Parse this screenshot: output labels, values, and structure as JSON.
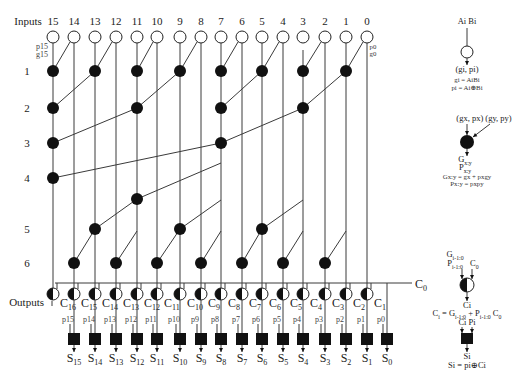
{
  "diagram": {
    "inputs_label": "Inputs",
    "outputs_label": "Outputs",
    "inputs": {
      "columns": [
        "15",
        "14",
        "13",
        "12",
        "11",
        "10",
        "9",
        "8",
        "7",
        "6",
        "5",
        "4",
        "3",
        "2",
        "1",
        "0"
      ]
    },
    "left_pg_labels": [
      "p15",
      "g15"
    ],
    "right_pg_labels": [
      "p0",
      "g0"
    ],
    "row_labels": [
      {
        "label": "1",
        "level": "1"
      },
      {
        "label": "2",
        "level": "2"
      },
      {
        "label": "3",
        "level": "3"
      },
      {
        "label": "4",
        "level": "4"
      },
      {
        "label": "5",
        "level": "5"
      },
      {
        "label": "6",
        "level": "6"
      }
    ],
    "prefix_edges": [
      {
        "to": [
          15,
          "1"
        ],
        "from": [
          14,
          "in"
        ]
      },
      {
        "to": [
          13,
          "1"
        ],
        "from": [
          12,
          "in"
        ]
      },
      {
        "to": [
          11,
          "1"
        ],
        "from": [
          10,
          "in"
        ]
      },
      {
        "to": [
          9,
          "1"
        ],
        "from": [
          8,
          "in"
        ]
      },
      {
        "to": [
          7,
          "1"
        ],
        "from": [
          6,
          "in"
        ]
      },
      {
        "to": [
          5,
          "1"
        ],
        "from": [
          4,
          "in"
        ]
      },
      {
        "to": [
          3,
          "1"
        ],
        "from": [
          2,
          "in"
        ]
      },
      {
        "to": [
          1,
          "1"
        ],
        "from": [
          0,
          "in"
        ]
      },
      {
        "to": [
          15,
          "2"
        ],
        "from": [
          13,
          "1"
        ]
      },
      {
        "to": [
          11,
          "2"
        ],
        "from": [
          9,
          "1"
        ]
      },
      {
        "to": [
          7,
          "2"
        ],
        "from": [
          5,
          "1"
        ]
      },
      {
        "to": [
          3,
          "2"
        ],
        "from": [
          1,
          "1"
        ]
      },
      {
        "to": [
          15,
          "3"
        ],
        "from": [
          11,
          "2"
        ]
      },
      {
        "to": [
          7,
          "3"
        ],
        "from": [
          3,
          "2"
        ]
      },
      {
        "to": [
          15,
          "4"
        ],
        "from": [
          7,
          "3"
        ]
      },
      {
        "to": [
          11,
          "4b"
        ],
        "from": [
          7,
          "w163"
        ]
      },
      {
        "to": [
          13,
          "5"
        ],
        "from": [
          11,
          "4b"
        ]
      },
      {
        "to": [
          9,
          "5"
        ],
        "from": [
          7,
          "w200"
        ]
      },
      {
        "to": [
          5,
          "5"
        ],
        "from": [
          3,
          "w200"
        ]
      },
      {
        "to": [
          14,
          "6"
        ],
        "from": [
          13,
          "5"
        ]
      },
      {
        "to": [
          12,
          "6"
        ],
        "from": [
          11,
          "w231"
        ]
      },
      {
        "to": [
          10,
          "6"
        ],
        "from": [
          9,
          "5"
        ]
      },
      {
        "to": [
          8,
          "6"
        ],
        "from": [
          7,
          "w231"
        ]
      },
      {
        "to": [
          6,
          "6"
        ],
        "from": [
          5,
          "5"
        ]
      },
      {
        "to": [
          4,
          "6"
        ],
        "from": [
          3,
          "w231"
        ]
      },
      {
        "to": [
          2,
          "6"
        ],
        "from": [
          1,
          "w231"
        ]
      }
    ],
    "carry_in": {
      "base": "C",
      "sub": "0"
    },
    "carry_outputs": [
      {
        "base": "C",
        "sub": "16"
      },
      {
        "base": "C",
        "sub": "15"
      },
      {
        "base": "C",
        "sub": "14"
      },
      {
        "base": "C",
        "sub": "13"
      },
      {
        "base": "C",
        "sub": "12"
      },
      {
        "base": "C",
        "sub": "11"
      },
      {
        "base": "C",
        "sub": "10"
      },
      {
        "base": "C",
        "sub": "9"
      },
      {
        "base": "C",
        "sub": "8"
      },
      {
        "base": "C",
        "sub": "7"
      },
      {
        "base": "C",
        "sub": "6"
      },
      {
        "base": "C",
        "sub": "5"
      },
      {
        "base": "C",
        "sub": "4"
      },
      {
        "base": "C",
        "sub": "3"
      },
      {
        "base": "C",
        "sub": "2"
      },
      {
        "base": "C",
        "sub": "1"
      }
    ],
    "propagate_labels": [
      "p15",
      "p14",
      "p13",
      "p12",
      "p11",
      "p10",
      "p9",
      "p8",
      "p7",
      "p6",
      "p5",
      "p4",
      "p3",
      "p2",
      "p1",
      "p0"
    ],
    "sum_outputs": [
      {
        "base": "S",
        "sub": "15"
      },
      {
        "base": "S",
        "sub": "14"
      },
      {
        "base": "S",
        "sub": "13"
      },
      {
        "base": "S",
        "sub": "12"
      },
      {
        "base": "S",
        "sub": "11"
      },
      {
        "base": "S",
        "sub": "10"
      },
      {
        "base": "S",
        "sub": "9"
      },
      {
        "base": "S",
        "sub": "8"
      },
      {
        "base": "S",
        "sub": "7"
      },
      {
        "base": "S",
        "sub": "6"
      },
      {
        "base": "S",
        "sub": "5"
      },
      {
        "base": "S",
        "sub": "4"
      },
      {
        "base": "S",
        "sub": "3"
      },
      {
        "base": "S",
        "sub": "2"
      },
      {
        "base": "S",
        "sub": "1"
      },
      {
        "base": "S",
        "sub": "0"
      }
    ]
  },
  "legend": {
    "pg_cell": {
      "inputs": "Ai  Bi",
      "output": "(gi, pi)",
      "eq_g": "gi = AiBi",
      "eq_p": "pi = Ai⊕Bi"
    },
    "prefix_cell": {
      "inputs": "(gx, px) (gy, py)",
      "out_g": {
        "base": "G",
        "sub": "x:y"
      },
      "out_p": {
        "base": "P",
        "sub": "x:y"
      },
      "eq_g": "Gx:y = gx + pxgy",
      "eq_p": "Px:y = pxpy"
    },
    "carry_cell": {
      "in_g": {
        "base": "G",
        "sub": "i-1:0"
      },
      "in_p": {
        "base": "P",
        "sub": "i-1:0"
      },
      "in_c": {
        "base": "C",
        "sub": "0"
      },
      "output": "Ci",
      "eq": [
        {
          "text": "C",
          "sub": "i"
        },
        {
          "text": " = G",
          "sub": "i-1:0"
        },
        {
          "text": " + P",
          "sub": "i-1:0"
        },
        {
          "text": " C",
          "sub": "0"
        }
      ]
    },
    "sum_cell": {
      "inputs": "Ci   Pi",
      "output": "Si",
      "eq": "Si = pi⊕Ci"
    }
  }
}
